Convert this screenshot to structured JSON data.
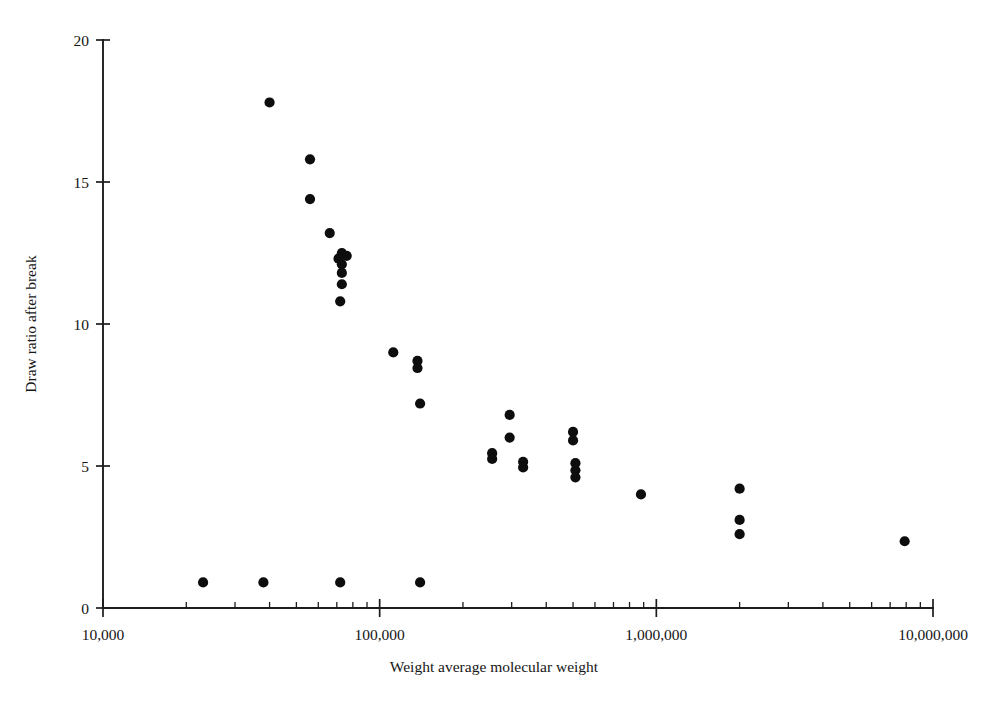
{
  "chart_data": {
    "type": "scatter",
    "title": "",
    "xlabel": "Weight average molecular weight",
    "ylabel": "Draw ratio after break",
    "xscale": "log",
    "yscale": "linear",
    "xlim": [
      10000,
      10000000
    ],
    "ylim": [
      0,
      20
    ],
    "grid": false,
    "legend": null,
    "xticks": [
      {
        "value": 10000,
        "label": "10,000"
      },
      {
        "value": 100000,
        "label": "100,000"
      },
      {
        "value": 1000000,
        "label": "1,000,000"
      },
      {
        "value": 10000000,
        "label": "10,000,000"
      }
    ],
    "yticks": [
      {
        "value": 0,
        "label": "0"
      },
      {
        "value": 5,
        "label": "5"
      },
      {
        "value": 10,
        "label": "10"
      },
      {
        "value": 15,
        "label": "15"
      },
      {
        "value": 20,
        "label": "20"
      }
    ],
    "marker": {
      "shape": "circle",
      "color": "#0d0d0d",
      "size": 9
    },
    "points": [
      {
        "x": 40000,
        "y": 17.8
      },
      {
        "x": 56000,
        "y": 15.8
      },
      {
        "x": 56000,
        "y": 14.4
      },
      {
        "x": 66000,
        "y": 13.2
      },
      {
        "x": 73000,
        "y": 12.5
      },
      {
        "x": 76000,
        "y": 12.4
      },
      {
        "x": 71000,
        "y": 12.3
      },
      {
        "x": 73000,
        "y": 12.1
      },
      {
        "x": 73000,
        "y": 11.8
      },
      {
        "x": 73000,
        "y": 11.4
      },
      {
        "x": 72000,
        "y": 10.8
      },
      {
        "x": 112000,
        "y": 9.0
      },
      {
        "x": 137000,
        "y": 8.7
      },
      {
        "x": 137000,
        "y": 8.45
      },
      {
        "x": 140000,
        "y": 7.2
      },
      {
        "x": 295000,
        "y": 6.8
      },
      {
        "x": 295000,
        "y": 6.0
      },
      {
        "x": 255000,
        "y": 5.45
      },
      {
        "x": 255000,
        "y": 5.25
      },
      {
        "x": 330000,
        "y": 5.15
      },
      {
        "x": 330000,
        "y": 4.95
      },
      {
        "x": 500000,
        "y": 6.2
      },
      {
        "x": 500000,
        "y": 5.9
      },
      {
        "x": 510000,
        "y": 5.1
      },
      {
        "x": 510000,
        "y": 4.85
      },
      {
        "x": 510000,
        "y": 4.6
      },
      {
        "x": 880000,
        "y": 4.0
      },
      {
        "x": 2000000,
        "y": 4.2
      },
      {
        "x": 2000000,
        "y": 3.1
      },
      {
        "x": 2000000,
        "y": 2.6
      },
      {
        "x": 7900000,
        "y": 2.35
      },
      {
        "x": 23000,
        "y": 0.9
      },
      {
        "x": 38000,
        "y": 0.9
      },
      {
        "x": 72000,
        "y": 0.9
      },
      {
        "x": 140000,
        "y": 0.9
      }
    ]
  },
  "axes": {
    "x_title": "Weight average molecular weight",
    "y_title": "Draw ratio after break"
  }
}
